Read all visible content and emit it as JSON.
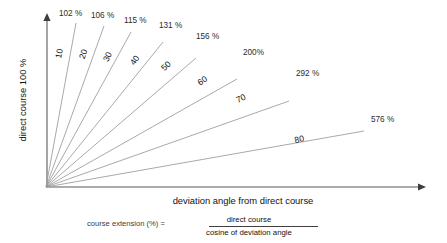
{
  "figure": {
    "title_alt": "Course extension as a function of deviation angle",
    "axes": {
      "y_label": "direct course 100 %",
      "x_label": "deviation angle from direct course",
      "origin": {
        "x": 46,
        "y": 187
      },
      "y_top": {
        "x": 47,
        "y": 14
      },
      "x_right": {
        "x": 425,
        "y": 187
      }
    },
    "formula": {
      "lhs": "course extension (%) =",
      "numerator": "direct course",
      "denominator": "cosine of deviation angle"
    }
  },
  "chart_data": {
    "type": "line",
    "xlabel": "deviation angle from direct course",
    "ylabel": "direct course 100 %",
    "grid": false,
    "legend": "none",
    "note": "Each ray leaves the origin at the stated deviation angle measured from the vertical (direct course) axis; the label at its tip is the resulting course extension = 100 / cos(angle).",
    "x": [
      10,
      20,
      30,
      40,
      50,
      60,
      70,
      80
    ],
    "values": [
      102,
      106,
      115,
      131,
      156,
      200,
      292,
      576
    ],
    "series": [
      {
        "name": "course extension (%)",
        "values": [
          102,
          106,
          115,
          131,
          156,
          200,
          292,
          576
        ]
      }
    ],
    "rays": [
      {
        "angle_label": "10",
        "angle_deg": 10,
        "pct_label": "102 %",
        "pct_value": 102,
        "ray_end": {
          "x": 76,
          "y": 23
        },
        "angle_text_pos": {
          "x": 62,
          "y": 54
        },
        "angle_text_rot": -79,
        "pct_text_pos": {
          "x": 59,
          "y": 16
        }
      },
      {
        "angle_label": "20",
        "angle_deg": 20,
        "pct_label": "106 %",
        "pct_value": 106,
        "ray_end": {
          "x": 104,
          "y": 26
        },
        "angle_text_pos": {
          "x": 86,
          "y": 55
        },
        "angle_text_rot": -72,
        "pct_text_pos": {
          "x": 91,
          "y": 18
        }
      },
      {
        "angle_label": "30",
        "angle_deg": 30,
        "pct_label": "115 %",
        "pct_value": 115,
        "ray_end": {
          "x": 131,
          "y": 32
        },
        "angle_text_pos": {
          "x": 110,
          "y": 58
        },
        "angle_text_rot": -64,
        "pct_text_pos": {
          "x": 124,
          "y": 23
        }
      },
      {
        "angle_label": "40",
        "angle_deg": 40,
        "pct_label": "131 %",
        "pct_value": 131,
        "ray_end": {
          "x": 163,
          "y": 42
        },
        "angle_text_pos": {
          "x": 137,
          "y": 62
        },
        "angle_text_rot": -54,
        "pct_text_pos": {
          "x": 159,
          "y": 28
        }
      },
      {
        "angle_label": "50",
        "angle_deg": 50,
        "pct_label": "156 %",
        "pct_value": 156,
        "ray_end": {
          "x": 196,
          "y": 58
        },
        "angle_text_pos": {
          "x": 168,
          "y": 68
        },
        "angle_text_rot": -44,
        "pct_text_pos": {
          "x": 196,
          "y": 39
        }
      },
      {
        "angle_label": "60",
        "angle_deg": 60,
        "pct_label": "200%",
        "pct_value": 200,
        "ray_end": {
          "x": 237,
          "y": 79
        },
        "angle_text_pos": {
          "x": 204,
          "y": 83
        },
        "angle_text_rot": -34,
        "pct_text_pos": {
          "x": 243,
          "y": 55
        }
      },
      {
        "angle_label": "70",
        "angle_deg": 70,
        "pct_label": "292 %",
        "pct_value": 292,
        "ray_end": {
          "x": 289,
          "y": 101
        },
        "angle_text_pos": {
          "x": 242,
          "y": 101
        },
        "angle_text_rot": -24,
        "pct_text_pos": {
          "x": 296,
          "y": 76
        }
      },
      {
        "angle_label": "80",
        "angle_deg": 80,
        "pct_label": "576 %",
        "pct_value": 576,
        "ray_end": {
          "x": 364,
          "y": 131
        },
        "angle_text_pos": {
          "x": 300,
          "y": 142
        },
        "angle_text_rot": -14,
        "pct_text_pos": {
          "x": 371,
          "y": 122
        }
      }
    ]
  }
}
